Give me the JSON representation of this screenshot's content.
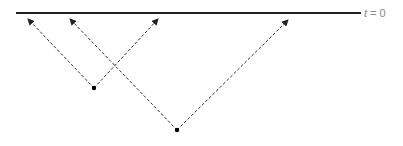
{
  "diagram": {
    "type": "spacetime-light-rays",
    "baseline": {
      "x1": 16,
      "y1": 13,
      "x2": 361,
      "y2": 13,
      "color": "#222222",
      "label_var": "t",
      "label_rest": " = 0",
      "label_color": "#8a8a8a"
    },
    "events": [
      {
        "id": "event-1",
        "x": 94,
        "y": 88,
        "rays": [
          {
            "direction": "up-left",
            "tip_x": 28,
            "tip_y": 19
          },
          {
            "direction": "up-right",
            "tip_x": 158,
            "tip_y": 19
          }
        ]
      },
      {
        "id": "event-2",
        "x": 177,
        "y": 130,
        "rays": [
          {
            "direction": "up-left",
            "tip_x": 70,
            "tip_y": 19
          },
          {
            "direction": "up-right",
            "tip_x": 288,
            "tip_y": 20
          }
        ]
      }
    ],
    "ray_color": "#333333",
    "dot_color": "#000000"
  }
}
